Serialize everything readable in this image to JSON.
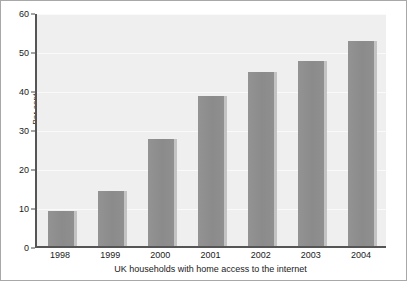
{
  "chart_data": {
    "type": "bar",
    "title": "",
    "xlabel": "UK households with home access to the internet",
    "ylabel": "Per cent",
    "categories": [
      "1998",
      "1999",
      "2000",
      "2001",
      "2002",
      "2003",
      "2004"
    ],
    "values": [
      9,
      14,
      27.5,
      38.5,
      44.5,
      47.5,
      52.5
    ],
    "ylim": [
      0,
      60
    ],
    "yticks": [
      0,
      10,
      20,
      30,
      40,
      50,
      60
    ],
    "ytick_labels": [
      "0",
      "10",
      "20",
      "30",
      "40",
      "50",
      "60"
    ],
    "grid": true,
    "legend": false,
    "colors": {
      "bar_fill": "#8f8f8f",
      "bar_shadow": "#c3c3c3",
      "plot_background": "#efefef",
      "gridline": "#fafafa",
      "axis": "#555555",
      "frame": "#a8a8a8",
      "text": "#1a1a1a"
    }
  }
}
